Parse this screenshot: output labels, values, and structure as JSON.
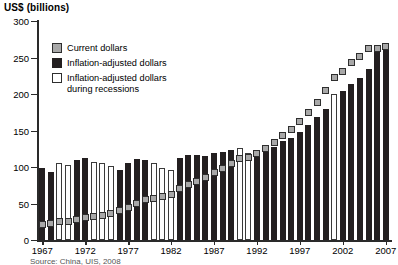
{
  "chart_data": {
    "type": "bar",
    "title": "",
    "ylabel": "US$ (billions)",
    "xlabel": "",
    "ylim": [
      0,
      300
    ],
    "yticks": [
      0,
      50,
      100,
      150,
      200,
      250,
      300
    ],
    "xticks": [
      1967,
      1972,
      1977,
      1982,
      1987,
      1992,
      1997,
      2002,
      2007
    ],
    "grid": false,
    "legend_position": "upper-left-inside",
    "categories": [
      1967,
      1968,
      1969,
      1970,
      1971,
      1972,
      1973,
      1974,
      1975,
      1976,
      1977,
      1978,
      1979,
      1980,
      1981,
      1982,
      1983,
      1984,
      1985,
      1986,
      1987,
      1988,
      1989,
      1990,
      1991,
      1992,
      1993,
      1994,
      1995,
      1996,
      1997,
      1998,
      1999,
      2000,
      2001,
      2002,
      2003,
      2004,
      2005,
      2006,
      2007
    ],
    "series": [
      {
        "name": "Inflation-adjusted dollars",
        "color": "#231f20",
        "values": [
          98,
          93,
          105,
          103,
          109,
          113,
          107,
          105,
          101,
          96,
          105,
          111,
          110,
          105,
          99,
          96,
          112,
          117,
          116,
          115,
          119,
          120,
          123,
          126,
          119,
          119,
          123,
          128,
          136,
          140,
          148,
          158,
          168,
          180,
          200,
          204,
          214,
          222,
          234,
          262,
          265
        ]
      },
      {
        "name": "Current dollars",
        "color": "#a8a8a8",
        "values": [
          21,
          22,
          25,
          26,
          28,
          31,
          32,
          34,
          37,
          40,
          45,
          50,
          55,
          57,
          60,
          63,
          70,
          76,
          80,
          85,
          92,
          98,
          105,
          112,
          113,
          118,
          126,
          133,
          143,
          152,
          163,
          175,
          188,
          205,
          223,
          231,
          243,
          252,
          262,
          262,
          265
        ]
      }
    ],
    "recession_years": [
      1969,
      1970,
      1973,
      1974,
      1975,
      1980,
      1981,
      1982,
      1990,
      1991,
      2001
    ],
    "recession_color": "#ffffff"
  },
  "axis_title": "US$ (billions)",
  "legend": {
    "items": [
      {
        "label": "Current dollars",
        "swatch": "current-dollars-swatch"
      },
      {
        "label": "Inflation-adjusted dollars",
        "swatch": "inflation-adjusted-swatch"
      },
      {
        "label": "Inflation-adjusted dollars\nduring recessions",
        "swatch": "recession-swatch"
      }
    ]
  },
  "source": {
    "text": "Source: China, UIS, 2008"
  }
}
